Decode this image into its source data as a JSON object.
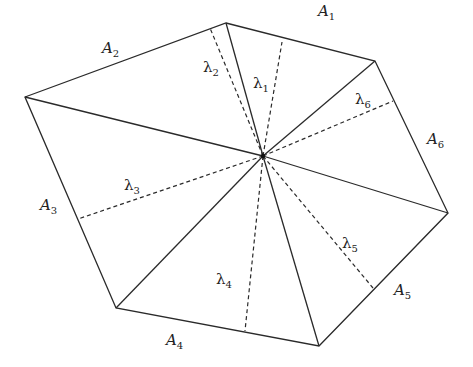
{
  "diagram": {
    "center": {
      "x": 263,
      "y": 156
    },
    "vertices": [
      {
        "x": 226,
        "y": 23
      },
      {
        "x": 375,
        "y": 61
      },
      {
        "x": 448,
        "y": 213
      },
      {
        "x": 319,
        "y": 346
      },
      {
        "x": 116,
        "y": 308
      },
      {
        "x": 25,
        "y": 97
      }
    ],
    "altitude_feet": [
      {
        "name": "lambda1",
        "x": 282,
        "y": 42
      },
      {
        "name": "lambda2",
        "x": 210,
        "y": 28
      },
      {
        "name": "lambda3",
        "x": 78,
        "y": 219
      },
      {
        "name": "lambda4",
        "x": 245,
        "y": 331
      },
      {
        "name": "lambda5",
        "x": 373,
        "y": 288
      },
      {
        "name": "lambda6",
        "x": 393,
        "y": 101
      }
    ],
    "area_labels": [
      {
        "base": "A",
        "sub": "1",
        "x": 318,
        "y": 16
      },
      {
        "base": "A",
        "sub": "2",
        "x": 102,
        "y": 53
      },
      {
        "base": "A",
        "sub": "3",
        "x": 40,
        "y": 210
      },
      {
        "base": "A",
        "sub": "4",
        "x": 166,
        "y": 345
      },
      {
        "base": "A",
        "sub": "5",
        "x": 394,
        "y": 295
      },
      {
        "base": "A",
        "sub": "6",
        "x": 427,
        "y": 144
      }
    ],
    "lambda_labels": [
      {
        "base": "λ",
        "sub": "1",
        "x": 253,
        "y": 88
      },
      {
        "base": "λ",
        "sub": "2",
        "x": 203,
        "y": 72
      },
      {
        "base": "λ",
        "sub": "3",
        "x": 124,
        "y": 190
      },
      {
        "base": "λ",
        "sub": "4",
        "x": 216,
        "y": 284
      },
      {
        "base": "λ",
        "sub": "5",
        "x": 342,
        "y": 248
      },
      {
        "base": "λ",
        "sub": "6",
        "x": 355,
        "y": 104
      }
    ]
  }
}
